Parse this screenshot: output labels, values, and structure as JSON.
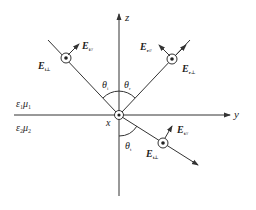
{
  "diagram": {
    "axes": {
      "z_label": "z",
      "y_label": "y",
      "x_label": "x"
    },
    "media": {
      "upper": {
        "eps": "ε",
        "eps_sub": "1",
        "mu": "μ",
        "mu_sub": "1"
      },
      "lower": {
        "eps": "ε",
        "eps_sub": "2",
        "mu": "μ",
        "mu_sub": "2"
      }
    },
    "angles": {
      "incident": {
        "sym": "θ",
        "sub": "i"
      },
      "reflected": {
        "sym": "θ",
        "sub": "r"
      },
      "transmitted": {
        "sym": "θ",
        "sub": "t"
      }
    },
    "vectors": {
      "incident_parallel": {
        "sym": "E",
        "sub": "i//"
      },
      "incident_perp": {
        "sym": "E",
        "sub": "i⊥"
      },
      "reflected_parallel": {
        "sym": "E",
        "sub": "r//"
      },
      "reflected_perp": {
        "sym": "E",
        "sub": "r⊥"
      },
      "transmitted_parallel": {
        "sym": "E",
        "sub": "t//"
      },
      "transmitted_perp": {
        "sym": "E",
        "sub": "t⊥"
      }
    },
    "colors": {
      "line": "#333333",
      "background": "#ffffff"
    }
  }
}
